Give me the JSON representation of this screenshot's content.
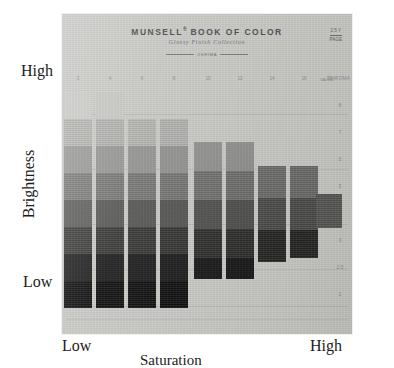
{
  "figure": {
    "y_axis": {
      "label": "Brightness",
      "high": "High",
      "low": "Low"
    },
    "x_axis": {
      "label": "Saturation",
      "low": "Low",
      "high": "High"
    }
  },
  "card": {
    "title": "MUNSELL",
    "title_sup": "®",
    "title_rest": " BOOK OF COLOR",
    "subtitle": "Glossy Finish Collection",
    "rule_text": "OSRIMA",
    "hue_mark_top": "2.5 Y",
    "hue_mark_bottom": "PAGE",
    "value_header": "VALUE",
    "chroma_header": "CHROMA",
    "background_color": "#c9c9c6"
  },
  "chart_data": {
    "type": "heatmap",
    "xlabel": "Saturation",
    "ylabel": "Brightness",
    "grid": true,
    "legend": "none",
    "x_tick_labels": [
      "2",
      "4",
      "6",
      "8",
      "10",
      "12",
      "14",
      "16",
      "18"
    ],
    "y_tick_labels": [
      "8",
      "7",
      "6",
      "5",
      "4",
      "3",
      "2.5",
      "2"
    ],
    "note": "Staircase of painted chips: chroma increases left to right, Munsell value (brightness) decreases top to bottom. Darker rows extend further right at mid chroma.",
    "columns": [
      {
        "chroma": "2",
        "x": 2,
        "width": 28,
        "chips": [
          {
            "value": "8",
            "y": 78,
            "height": 27,
            "color": "#cdcdca"
          },
          {
            "value": "7",
            "y": 105,
            "height": 27,
            "color": "#b4b4b1"
          },
          {
            "value": "6",
            "y": 132,
            "height": 27,
            "color": "#9a9a98"
          },
          {
            "value": "5",
            "y": 159,
            "height": 27,
            "color": "#7c7c7a"
          },
          {
            "value": "4",
            "y": 186,
            "height": 27,
            "color": "#5d5d5c"
          },
          {
            "value": "3",
            "y": 213,
            "height": 27,
            "color": "#3c3c3b"
          },
          {
            "value": "2.5",
            "y": 240,
            "height": 27,
            "color": "#1d1d1d"
          },
          {
            "value": "2",
            "y": 267,
            "height": 27,
            "color": "#0d0d0d"
          }
        ]
      },
      {
        "chroma": "4",
        "x": 34,
        "width": 28,
        "chips": [
          {
            "value": "8",
            "y": 78,
            "height": 27,
            "color": "#c9c9c6"
          },
          {
            "value": "7",
            "y": 105,
            "height": 27,
            "color": "#b1b1ae"
          },
          {
            "value": "6",
            "y": 132,
            "height": 27,
            "color": "#979795"
          },
          {
            "value": "5",
            "y": 159,
            "height": 27,
            "color": "#787876"
          },
          {
            "value": "4",
            "y": 186,
            "height": 27,
            "color": "#585857"
          },
          {
            "value": "3",
            "y": 213,
            "height": 27,
            "color": "#383837"
          },
          {
            "value": "2.5",
            "y": 240,
            "height": 27,
            "color": "#1a1a1a"
          },
          {
            "value": "2",
            "y": 267,
            "height": 27,
            "color": "#0b0b0b"
          }
        ]
      },
      {
        "chroma": "6",
        "x": 66,
        "width": 28,
        "chips": [
          {
            "value": "7",
            "y": 105,
            "height": 27,
            "color": "#b3b3b0"
          },
          {
            "value": "6",
            "y": 132,
            "height": 27,
            "color": "#959593"
          },
          {
            "value": "5",
            "y": 159,
            "height": 27,
            "color": "#767674"
          },
          {
            "value": "4",
            "y": 186,
            "height": 27,
            "color": "#555554"
          },
          {
            "value": "3",
            "y": 213,
            "height": 27,
            "color": "#353534"
          },
          {
            "value": "2.5",
            "y": 240,
            "height": 27,
            "color": "#191919"
          },
          {
            "value": "2",
            "y": 267,
            "height": 27,
            "color": "#0b0b0b"
          }
        ]
      },
      {
        "chroma": "8",
        "x": 98,
        "width": 28,
        "chips": [
          {
            "value": "7",
            "y": 105,
            "height": 27,
            "color": "#b0b0ad"
          },
          {
            "value": "6",
            "y": 132,
            "height": 27,
            "color": "#929290"
          },
          {
            "value": "5",
            "y": 159,
            "height": 27,
            "color": "#737371"
          },
          {
            "value": "4",
            "y": 186,
            "height": 27,
            "color": "#525251"
          },
          {
            "value": "3",
            "y": 213,
            "height": 27,
            "color": "#323231"
          },
          {
            "value": "2.5",
            "y": 240,
            "height": 27,
            "color": "#171717"
          },
          {
            "value": "2",
            "y": 267,
            "height": 27,
            "color": "#0a0a0a"
          }
        ]
      },
      {
        "chroma": "10",
        "x": 132,
        "width": 28,
        "chips": [
          {
            "value": "6",
            "y": 128,
            "height": 29,
            "color": "#929290"
          },
          {
            "value": "5",
            "y": 157,
            "height": 29,
            "color": "#6f6f6d"
          },
          {
            "value": "4",
            "y": 186,
            "height": 29,
            "color": "#4e4e4d"
          },
          {
            "value": "3",
            "y": 215,
            "height": 29,
            "color": "#2c2c2b"
          },
          {
            "value": "2.5",
            "y": 244,
            "height": 21,
            "color": "#131313"
          }
        ]
      },
      {
        "chroma": "12",
        "x": 164,
        "width": 28,
        "chips": [
          {
            "value": "6",
            "y": 128,
            "height": 29,
            "color": "#8f8f8d"
          },
          {
            "value": "5",
            "y": 157,
            "height": 29,
            "color": "#6c6c6a"
          },
          {
            "value": "4",
            "y": 186,
            "height": 29,
            "color": "#4b4b4a"
          },
          {
            "value": "3",
            "y": 215,
            "height": 29,
            "color": "#2a2a29"
          },
          {
            "value": "2.5",
            "y": 244,
            "height": 21,
            "color": "#121212"
          }
        ]
      },
      {
        "chroma": "14",
        "x": 196,
        "width": 28,
        "chips": [
          {
            "value": "5",
            "y": 152,
            "height": 32,
            "color": "#6b6b69"
          },
          {
            "value": "4",
            "y": 184,
            "height": 32,
            "color": "#4a4a49"
          },
          {
            "value": "3",
            "y": 216,
            "height": 32,
            "color": "#232322"
          }
        ]
      },
      {
        "chroma": "16",
        "x": 228,
        "width": 28,
        "chips": [
          {
            "value": "5",
            "y": 152,
            "height": 32,
            "color": "#6a6a68"
          },
          {
            "value": "4",
            "y": 184,
            "height": 32,
            "color": "#4a4a49"
          },
          {
            "value": "3",
            "y": 216,
            "height": 28,
            "color": "#232322"
          }
        ]
      },
      {
        "chroma": "18",
        "x": 254,
        "width": 26,
        "chips": [
          {
            "value": "4",
            "y": 180,
            "height": 34,
            "color": "#565655"
          }
        ]
      }
    ]
  }
}
